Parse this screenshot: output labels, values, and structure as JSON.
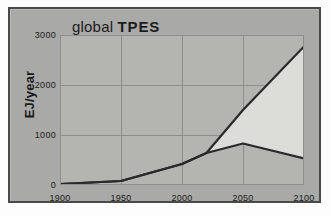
{
  "chart_data": {
    "type": "line",
    "title": "global TPES",
    "title_parts": {
      "lower": "global ",
      "upper": "TPES"
    },
    "xlabel": "",
    "ylabel": "EJ/year",
    "xlim": [
      1900,
      2100
    ],
    "ylim": [
      0,
      3000
    ],
    "xticks": [
      1900,
      1950,
      2000,
      2050,
      2100
    ],
    "yticks": [
      0,
      1000,
      2000,
      3000
    ],
    "grid": true,
    "legend": "none",
    "shaded_between_series": true,
    "series": [
      {
        "name": "upper",
        "x": [
          1900,
          1950,
          2000,
          2020,
          2050,
          2100
        ],
        "values": [
          20,
          80,
          420,
          640,
          1500,
          2770
        ]
      },
      {
        "name": "lower",
        "x": [
          1900,
          1950,
          2000,
          2020,
          2050,
          2100
        ],
        "values": [
          20,
          80,
          420,
          640,
          830,
          530
        ]
      }
    ],
    "colors": {
      "line": "#2a2a2a",
      "shaded_band": "#dcdcd8",
      "plot_background": "#b4b4b1",
      "card_background": "#a9a9a7",
      "frame": "#4a4a4a",
      "gridline": "#8e8e8b",
      "page_background": "#fdfdfd"
    }
  }
}
